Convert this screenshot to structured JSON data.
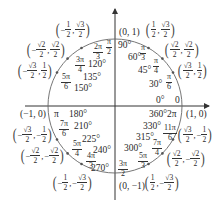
{
  "diagram": {
    "center_px": [
      115,
      106
    ],
    "radius_px": 67,
    "colors": {
      "axis": "#333333",
      "circle": "#666666",
      "text": "#2a2a2a"
    },
    "axis_points": [
      {
        "id": "pos-x",
        "label": "(1, 0)"
      },
      {
        "id": "pos-y",
        "label": "(0, 1)"
      },
      {
        "id": "neg-x",
        "label": "(−1, 0)"
      },
      {
        "id": "neg-y",
        "label": "(0, −1)"
      }
    ],
    "angles": [
      {
        "deg": "0°",
        "rad": "0"
      },
      {
        "deg": "30°",
        "rad_num": "π",
        "rad_den": "6"
      },
      {
        "deg": "45°",
        "rad_num": "π",
        "rad_den": "4"
      },
      {
        "deg": "60°",
        "rad_num": "π",
        "rad_den": "3"
      },
      {
        "deg": "90°",
        "rad_num": "π",
        "rad_den": "2"
      },
      {
        "deg": "120°",
        "rad_num": "2π",
        "rad_den": "3"
      },
      {
        "deg": "135°",
        "rad_num": "3π",
        "rad_den": "4"
      },
      {
        "deg": "150°",
        "rad_num": "5π",
        "rad_den": "6"
      },
      {
        "deg": "180°",
        "rad": "π"
      },
      {
        "deg": "210°",
        "rad_num": "7π",
        "rad_den": "6"
      },
      {
        "deg": "225°",
        "rad_num": "5π",
        "rad_den": "4"
      },
      {
        "deg": "240°",
        "rad_num": "4π",
        "rad_den": "3"
      },
      {
        "deg": "270°",
        "rad_num": "3π",
        "rad_den": "2"
      },
      {
        "deg": "300°",
        "rad_num": "5π",
        "rad_den": "3"
      },
      {
        "deg": "315°",
        "rad_num": "7π",
        "rad_den": "4"
      },
      {
        "deg": "330°",
        "rad_num": "11π",
        "rad_den": "6"
      },
      {
        "deg": "360°",
        "rad": "2π"
      }
    ],
    "coords": [
      {
        "angle": "30",
        "x_num": "√3",
        "x_den": "2",
        "y_num": "1",
        "y_den": "2",
        "x_sign": "",
        "y_sign": ""
      },
      {
        "angle": "45",
        "x_num": "√2",
        "x_den": "2",
        "y_num": "√2",
        "y_den": "2",
        "x_sign": "",
        "y_sign": ""
      },
      {
        "angle": "60",
        "x_num": "1",
        "x_den": "2",
        "y_num": "√3",
        "y_den": "2",
        "x_sign": "",
        "y_sign": ""
      },
      {
        "angle": "120",
        "x_num": "1",
        "x_den": "2",
        "y_num": "√3",
        "y_den": "2",
        "x_sign": "−",
        "y_sign": ""
      },
      {
        "angle": "135",
        "x_num": "√2",
        "x_den": "2",
        "y_num": "√2",
        "y_den": "2",
        "x_sign": "−",
        "y_sign": ""
      },
      {
        "angle": "150",
        "x_num": "√3",
        "x_den": "2",
        "y_num": "1",
        "y_den": "2",
        "x_sign": "−",
        "y_sign": ""
      },
      {
        "angle": "210",
        "x_num": "√3",
        "x_den": "2",
        "y_num": "1",
        "y_den": "2",
        "x_sign": "−",
        "y_sign": "−"
      },
      {
        "angle": "225",
        "x_num": "√2",
        "x_den": "2",
        "y_num": "√2",
        "y_den": "2",
        "x_sign": "−",
        "y_sign": "−"
      },
      {
        "angle": "240",
        "x_num": "1",
        "x_den": "2",
        "y_num": "√3",
        "y_den": "2",
        "x_sign": "−",
        "y_sign": "−"
      },
      {
        "angle": "300",
        "x_num": "1",
        "x_den": "2",
        "y_num": "√3",
        "y_den": "2",
        "x_sign": "",
        "y_sign": "−"
      },
      {
        "angle": "315",
        "x_num": "√2",
        "x_den": "2",
        "y_num": "√2",
        "y_den": "2",
        "x_sign": "",
        "y_sign": "−"
      },
      {
        "angle": "330",
        "x_num": "√3",
        "x_den": "2",
        "y_num": "1",
        "y_den": "2",
        "x_sign": "",
        "y_sign": "−"
      }
    ]
  }
}
